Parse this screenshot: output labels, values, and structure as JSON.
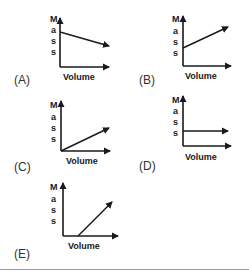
{
  "options": [
    {
      "label": "(A)",
      "x_axis": "Volume",
      "y_axis": [
        "M",
        "a",
        "s",
        "s"
      ],
      "relationship": "decreasing line with positive intercept"
    },
    {
      "label": "(B)",
      "x_axis": "Volume",
      "y_axis": [
        "M",
        "a",
        "s",
        "s"
      ],
      "relationship": "increasing line with positive intercept"
    },
    {
      "label": "(C)",
      "x_axis": "Volume",
      "y_axis": [
        "M",
        "a",
        "s",
        "s"
      ],
      "relationship": "increasing line through origin"
    },
    {
      "label": "(D)",
      "x_axis": "Volume",
      "y_axis": [
        "M",
        "a",
        "s",
        "s"
      ],
      "relationship": "horizontal line (constant mass)"
    },
    {
      "label": "(E)",
      "x_axis": "Volume",
      "y_axis": [
        "M",
        "a",
        "s",
        "s"
      ],
      "relationship": "increasing line with positive volume intercept"
    }
  ],
  "colors": {
    "line": "#1a1a1a",
    "divider": "#9a9a9a"
  }
}
